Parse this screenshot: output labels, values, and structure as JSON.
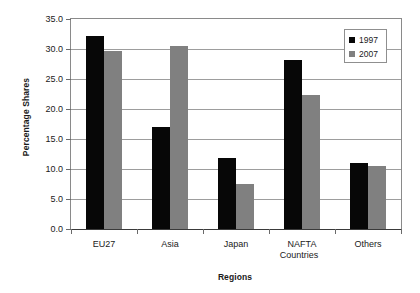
{
  "chart_data": {
    "type": "bar",
    "title": "",
    "xlabel": "Regions",
    "ylabel": "Percentage Shares",
    "categories": [
      "EU27",
      "Asia",
      "Japan",
      "NAFTA Countries",
      "Others"
    ],
    "category_lines": [
      [
        "EU27"
      ],
      [
        "Asia"
      ],
      [
        "Japan"
      ],
      [
        "NAFTA",
        "Countries"
      ],
      [
        "Others"
      ]
    ],
    "series": [
      {
        "name": "1997",
        "color": "#070707",
        "values": [
          32.2,
          17.0,
          11.8,
          28.2,
          11.0
        ]
      },
      {
        "name": "2007",
        "color": "#808080",
        "values": [
          29.7,
          30.5,
          7.5,
          22.3,
          10.5
        ]
      }
    ],
    "ylim": [
      0.0,
      35.0
    ],
    "ytick_step": 5.0,
    "ytick_labels": [
      "0.0",
      "5.0",
      "10.0",
      "15.0",
      "20.0",
      "25.0",
      "30.0",
      "35.0"
    ],
    "ytick_values": [
      0.0,
      5.0,
      10.0,
      15.0,
      20.0,
      25.0,
      30.0,
      35.0
    ],
    "grid": true,
    "legend_position": "top-right",
    "legend_entries": [
      "1997",
      "2007"
    ]
  }
}
